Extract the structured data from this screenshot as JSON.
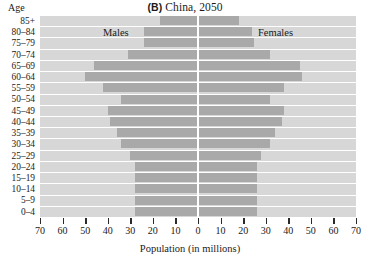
{
  "title": {
    "panel": "(B)",
    "text": "China, 2050"
  },
  "axes": {
    "y_title": "Age",
    "x_title": "Population (in millions)",
    "x_ticks": [
      70,
      60,
      50,
      40,
      30,
      20,
      10,
      0,
      10,
      20,
      30,
      40,
      50,
      60,
      70
    ],
    "x_max": 70,
    "x_step": 10
  },
  "labels": {
    "males": "Males",
    "females": "Females"
  },
  "colors": {
    "plot_background": "#d7d7d7",
    "bar": "#a9a9a9",
    "gridline": "#ffffff",
    "axis_line": "#ffffff",
    "text": "#1a1a1a"
  },
  "chart_data": {
    "type": "bar",
    "title": "(B) China, 2050",
    "xlabel": "Population (in millions)",
    "ylabel": "Age",
    "xlim": [
      -70,
      70
    ],
    "grid": true,
    "legend": "in-plot labels: Males (left), Females (right)",
    "orientation": "horizontal-diverging-population-pyramid",
    "categories": [
      "85+",
      "80-84",
      "75-79",
      "70-74",
      "65-69",
      "60-64",
      "55-59",
      "50-54",
      "45-49",
      "40-44",
      "35-39",
      "30-34",
      "25-29",
      "20-24",
      "15-19",
      "10-14",
      "5-9",
      "0-4"
    ],
    "series": [
      {
        "name": "Males",
        "values": [
          17,
          24,
          24,
          31,
          46,
          50,
          42,
          34,
          40,
          39,
          36,
          34,
          30,
          28,
          28,
          28,
          28,
          28
        ]
      },
      {
        "name": "Females",
        "values": [
          18,
          24,
          25,
          32,
          45,
          46,
          38,
          32,
          38,
          37,
          34,
          32,
          28,
          26,
          26,
          26,
          26,
          26
        ]
      }
    ]
  }
}
